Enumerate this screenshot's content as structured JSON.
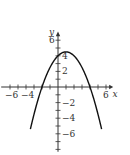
{
  "chart_data": {
    "type": "line",
    "title": "",
    "xlabel": "x",
    "ylabel": "y",
    "xlim": [
      -7,
      7
    ],
    "ylim": [
      -8.5,
      7.5
    ],
    "grid": false,
    "x_tick_labels": [
      "-6",
      "-4",
      "6"
    ],
    "y_tick_labels": [
      "6",
      "4",
      "2",
      "-2",
      "-4",
      "-6"
    ],
    "series": [
      {
        "name": "parabola",
        "equation": "y = -0.5x^2 + x + 4",
        "x": [
          -3.4,
          -3,
          -2,
          -1,
          0,
          1,
          2,
          3,
          4,
          5,
          5.4
        ],
        "y": [
          -5.18,
          -3.5,
          0,
          2.5,
          4,
          4.5,
          4,
          2.5,
          0,
          -3.5,
          -5.18
        ]
      }
    ]
  },
  "axes": {
    "x_label": "x",
    "y_label": "y"
  },
  "style": {
    "curve_color": "#111111",
    "axis_color": "#333333"
  }
}
